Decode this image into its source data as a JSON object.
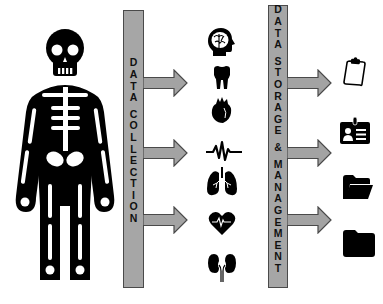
{
  "diagram": {
    "subject": {
      "label": "skeleton-figure"
    },
    "bars": [
      {
        "id": "collection",
        "label": "DATA COLLECTION",
        "letters": [
          "D",
          "A",
          "T",
          "A",
          "",
          "C",
          "O",
          "L",
          "L",
          "E",
          "C",
          "T",
          "I",
          "O",
          "N"
        ]
      },
      {
        "id": "storage",
        "label": "DATA STORAGE & MANAGEMENT",
        "letters": [
          "D",
          "A",
          "T",
          "A",
          "",
          "S",
          "T",
          "O",
          "R",
          "A",
          "G",
          "E",
          "",
          "&",
          "",
          "M",
          "A",
          "N",
          "A",
          "G",
          "E",
          "M",
          "E",
          "N",
          "T"
        ]
      }
    ],
    "data_sources": [
      {
        "icon": "brain-head-icon"
      },
      {
        "icon": "tooth-icon"
      },
      {
        "icon": "heart-icon"
      },
      {
        "icon": "ecg-wave-icon"
      },
      {
        "icon": "lungs-icon"
      },
      {
        "icon": "heart-rate-icon"
      },
      {
        "icon": "kidneys-icon"
      }
    ],
    "storage_outputs": [
      {
        "icon": "clipboard-icon"
      },
      {
        "icon": "id-badge-icon"
      },
      {
        "icon": "open-folder-icon"
      },
      {
        "icon": "folder-icon"
      }
    ],
    "colors": {
      "bar_fill": "#a6a6a6",
      "bar_border": "#4a4a4a",
      "arrow_fill": "#a3a3a3",
      "icon_fill": "#000000",
      "background": "#ffffff"
    }
  }
}
